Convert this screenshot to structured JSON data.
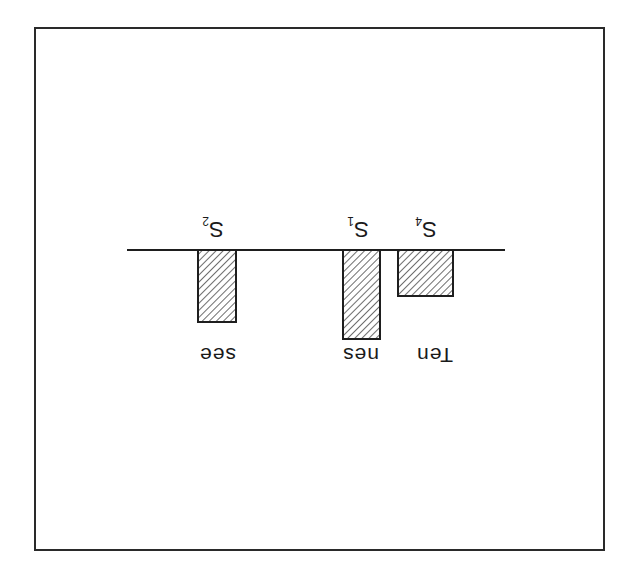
{
  "figure": {
    "orientation": "rotated 180 degrees",
    "frame_color": "#2a2a2a",
    "hatch_color": "#1e1e1e",
    "bars": [
      {
        "id": "S4",
        "symbol": "S",
        "subscript": "4",
        "word": "Ten",
        "relative_height": 46
      },
      {
        "id": "S1",
        "symbol": "S",
        "subscript": "1",
        "word": "nes",
        "relative_height": 89
      },
      {
        "id": "S2",
        "symbol": "S",
        "subscript": "2",
        "word": "see",
        "relative_height": 72
      }
    ]
  }
}
